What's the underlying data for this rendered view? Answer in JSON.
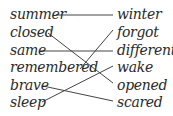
{
  "exercise": {
    "left_words": [
      {
        "text": "summer",
        "x": 10,
        "y": 6
      },
      {
        "text": "closed",
        "x": 10,
        "y": 24
      },
      {
        "text": "same",
        "x": 10,
        "y": 42
      },
      {
        "text": "remembered",
        "x": 10,
        "y": 59
      },
      {
        "text": "brave",
        "x": 10,
        "y": 77
      },
      {
        "text": "sleep",
        "x": 10,
        "y": 94
      }
    ],
    "right_words": [
      {
        "text": "winter",
        "x": 117,
        "y": 6
      },
      {
        "text": "forgot",
        "x": 117,
        "y": 24
      },
      {
        "text": "different",
        "x": 117,
        "y": 42
      },
      {
        "text": "wake",
        "x": 117,
        "y": 59
      },
      {
        "text": "opened",
        "x": 117,
        "y": 77
      },
      {
        "text": "scared",
        "x": 117,
        "y": 94
      }
    ],
    "matches": [
      {
        "left": "summer",
        "right": "winter",
        "x1": 56,
        "y1": 15,
        "x2": 113,
        "y2": 15
      },
      {
        "left": "closed",
        "right": "opened",
        "x1": 48,
        "y1": 33,
        "x2": 113,
        "y2": 83
      },
      {
        "left": "same",
        "right": "different",
        "x1": 40,
        "y1": 51,
        "x2": 113,
        "y2": 51
      },
      {
        "left": "remembered",
        "right": "forgot",
        "x1": 80,
        "y1": 69,
        "x2": 113,
        "y2": 30
      },
      {
        "left": "brave",
        "right": "scared",
        "x1": 43,
        "y1": 86,
        "x2": 113,
        "y2": 101
      },
      {
        "left": "sleep",
        "right": "wake",
        "x1": 42,
        "y1": 102,
        "x2": 113,
        "y2": 66
      }
    ]
  }
}
